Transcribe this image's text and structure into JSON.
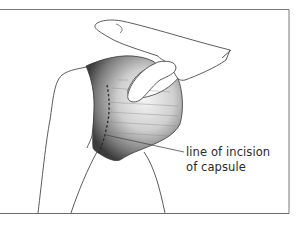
{
  "figure": {
    "label": {
      "line1": "line of incision",
      "line2": "of capsule"
    },
    "colors": {
      "outline": "#4a4a4a",
      "frame": "#6e6e6e",
      "capsule_dark": "#3e3e3e",
      "capsule_light": "#f2f2f2",
      "background": "#ffffff"
    }
  }
}
